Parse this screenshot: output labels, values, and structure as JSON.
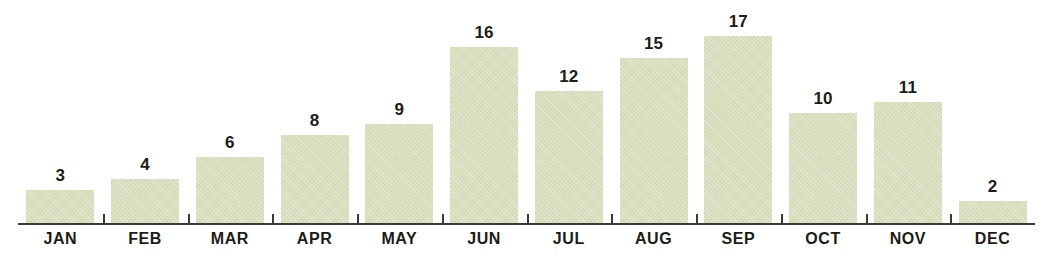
{
  "chart_data": {
    "type": "bar",
    "title": "",
    "subtitle": "",
    "xlabel": "",
    "ylabel": "",
    "categories": [
      "JAN",
      "FEB",
      "MAR",
      "APR",
      "MAY",
      "JUN",
      "JUL",
      "AUG",
      "SEP",
      "OCT",
      "NOV",
      "DEC"
    ],
    "values": [
      3,
      4,
      6,
      8,
      9,
      16,
      12,
      15,
      17,
      10,
      11,
      2
    ],
    "value_labels": [
      "3",
      "4",
      "6",
      "8",
      "9",
      "16",
      "12",
      "15",
      "17",
      "10",
      "11",
      "2"
    ],
    "ylim": [
      0,
      17
    ],
    "grid": false,
    "legend": null,
    "axis": {
      "baseline_visible": true,
      "ticks_visible": true,
      "y_axis_visible": false
    },
    "colors": {
      "bar_fill": "#d6debb",
      "axis": "#3a3a32",
      "label_text": "#1c1c18",
      "background": "#ffffff"
    }
  }
}
